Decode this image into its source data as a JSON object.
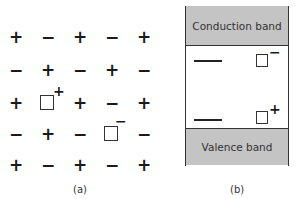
{
  "panel_a": {
    "caption": "(a)",
    "rows": [
      [
        "+",
        "−",
        "+",
        "−",
        "+"
      ],
      [
        "−",
        "+",
        "−",
        "+",
        "−"
      ],
      [
        "+",
        "□",
        "+",
        "−",
        "+"
      ],
      [
        "−",
        "+",
        "−",
        "□",
        "−"
      ],
      [
        "+",
        "−",
        "+",
        "−",
        "+"
      ]
    ],
    "cells": {
      "r0c0": "+",
      "r0c1": "−",
      "r0c2": "+",
      "r0c3": "−",
      "r0c4": "+",
      "r1c0": "−",
      "r1c1": "+",
      "r1c2": "−",
      "r1c3": "+",
      "r1c4": "−",
      "r2c0": "+",
      "r2c2": "+",
      "r2c3": "−",
      "r2c4": "+",
      "r3c0": "−",
      "r3c1": "+",
      "r3c2": "−",
      "r3c4": "−",
      "r4c0": "+",
      "r4c1": "−",
      "r4c2": "+",
      "r4c3": "−",
      "r4c4": "+"
    },
    "vacancies": [
      {
        "row": 2,
        "col": 1,
        "charge": "+"
      },
      {
        "row": 3,
        "col": 3,
        "charge": "−"
      }
    ],
    "vac1_charge": "+",
    "vac2_charge": "−"
  },
  "panel_b": {
    "caption": "(b)",
    "conduction_band": "Conduction band",
    "valence_band": "Valence band",
    "upper_level_charge": "−",
    "lower_level_charge": "+",
    "band_color": "#c4c4c4"
  }
}
